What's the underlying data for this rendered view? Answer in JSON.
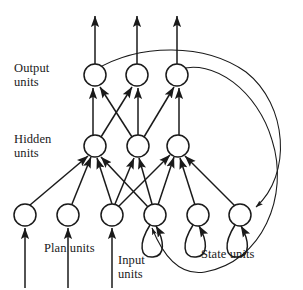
{
  "figure": {
    "width": 303,
    "height": 290,
    "background_color": "#ffffff",
    "stroke_color": "#1a1a1a",
    "node_fill": "#ffffff",
    "node_radius": 11
  },
  "labels": {
    "output_units": "Output\nunits",
    "hidden_units": "Hidden\nunits",
    "plan_units": "Plan units",
    "input_units": "Input\nunits",
    "state_units": "State units"
  },
  "caption": "",
  "layers": [
    {
      "name": "output",
      "label": "Output units",
      "count": 3,
      "y": 75,
      "nodes": [
        {
          "id": "o1",
          "cx": 95,
          "cy": 75
        },
        {
          "id": "o2",
          "cx": 137,
          "cy": 75
        },
        {
          "id": "o3",
          "cx": 177,
          "cy": 75
        }
      ]
    },
    {
      "name": "hidden",
      "label": "Hidden units",
      "count": 3,
      "y": 146,
      "nodes": [
        {
          "id": "h1",
          "cx": 95,
          "cy": 146
        },
        {
          "id": "h2",
          "cx": 138,
          "cy": 146
        },
        {
          "id": "h3",
          "cx": 178,
          "cy": 146
        }
      ]
    },
    {
      "name": "bottom",
      "label": "Plan, Input and State units",
      "count": 6,
      "y": 215,
      "nodes": [
        {
          "id": "p1",
          "cx": 25,
          "cy": 215,
          "group": "plan"
        },
        {
          "id": "p2",
          "cx": 68,
          "cy": 215,
          "group": "plan"
        },
        {
          "id": "i1",
          "cx": 112,
          "cy": 215,
          "group": "input"
        },
        {
          "id": "s1",
          "cx": 155,
          "cy": 215,
          "group": "state"
        },
        {
          "id": "s2",
          "cx": 198,
          "cy": 215,
          "group": "state"
        },
        {
          "id": "s3",
          "cx": 240,
          "cy": 215,
          "group": "state"
        }
      ]
    }
  ],
  "external_inputs": [
    {
      "to": "p1",
      "x": 25,
      "from_y": 283,
      "to_y": 228
    },
    {
      "to": "p2",
      "x": 68,
      "from_y": 283,
      "to_y": 228
    },
    {
      "to": "i1",
      "x": 112,
      "from_y": 283,
      "to_y": 228
    }
  ],
  "external_outputs": [
    {
      "from": "o1",
      "x": 95,
      "from_y": 64,
      "to_y": 16
    },
    {
      "from": "o2",
      "x": 137,
      "from_y": 64,
      "to_y": 16
    },
    {
      "from": "o3",
      "x": 177,
      "from_y": 64,
      "to_y": 16
    }
  ],
  "connections": {
    "hidden_to_output": [
      {
        "from": "h1",
        "to": "o1"
      },
      {
        "from": "h1",
        "to": "o2"
      },
      {
        "from": "h2",
        "to": "o1"
      },
      {
        "from": "h2",
        "to": "o2"
      },
      {
        "from": "h2",
        "to": "o3"
      },
      {
        "from": "h3",
        "to": "o3"
      }
    ],
    "bottom_to_hidden": [
      {
        "from": "p1",
        "to": "h1"
      },
      {
        "from": "p2",
        "to": "h1"
      },
      {
        "from": "i1",
        "to": "h1"
      },
      {
        "from": "i1",
        "to": "h2"
      },
      {
        "from": "i1",
        "to": "h3"
      },
      {
        "from": "s1",
        "to": "h1"
      },
      {
        "from": "s1",
        "to": "h2"
      },
      {
        "from": "s1",
        "to": "h3"
      },
      {
        "from": "s2",
        "to": "h3"
      },
      {
        "from": "s3",
        "to": "h3"
      }
    ],
    "self_loops": [
      {
        "node": "s1"
      },
      {
        "node": "s2"
      },
      {
        "node": "s3"
      }
    ],
    "recurrent": [
      {
        "from": "o1",
        "to": "s3",
        "path_label": "outer-right-sweep"
      },
      {
        "from": "o3",
        "to": "s1",
        "path_label": "outer-bottom-sweep"
      }
    ]
  }
}
